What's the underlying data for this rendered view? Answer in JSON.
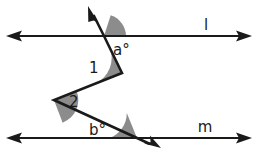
{
  "figure": {
    "background_color": "#ffffff",
    "stroke_color": "#1a1a1a",
    "wedge_color": "#8c8c8c",
    "width": 258,
    "height": 155
  },
  "labels": {
    "line_l": "l",
    "line_m": "m",
    "angle_a": "a°",
    "angle_b": "b°",
    "angle_1": "1",
    "angle_2": "2"
  },
  "geometry": {
    "line_l_y": 36,
    "line_m_y": 138,
    "line_l_x_start": 6,
    "line_l_x_end": 252,
    "line_m_x_start": 6,
    "line_m_x_end": 252,
    "ray_top_tip_x": 88,
    "ray_top_tip_y": 6,
    "intersection_l_x": 104,
    "intersection_l_y": 36,
    "vertex1_x": 122,
    "vertex1_y": 73,
    "vertex2_x": 54,
    "vertex2_y": 100,
    "intersection_m_x": 137,
    "intersection_m_y": 138,
    "ray_bottom_tip_x": 160,
    "ray_bottom_tip_y": 147
  },
  "angle_marks": [
    {
      "name": "angle-a",
      "label": "a°",
      "vertex": "intersection-with-line-l",
      "shaded": true
    },
    {
      "name": "angle-1",
      "label": "1",
      "vertex": "zigzag-vertex-1",
      "shaded": true
    },
    {
      "name": "angle-2",
      "label": "2",
      "vertex": "zigzag-vertex-2",
      "shaded": true
    },
    {
      "name": "angle-b",
      "label": "b°",
      "vertex": "intersection-with-line-m",
      "shaded": true
    }
  ]
}
